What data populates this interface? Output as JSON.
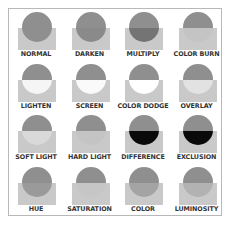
{
  "colors": {
    "frame_border": "#b8b8b8",
    "rect": "#c9c9c9",
    "circle": "#8f8f8f",
    "label": "#333333"
  },
  "modes": [
    {
      "label": "NORMAL",
      "top": "#8f8f8f",
      "bottom": "#8f8f8f",
      "rect": "#c9c9c9"
    },
    {
      "label": "DARKEN",
      "top": "#8f8f8f",
      "bottom": "#8a8a8a",
      "rect": "#c9c9c9"
    },
    {
      "label": "MULTIPLY",
      "top": "#8f8f8f",
      "bottom": "#747474",
      "rect": "#c9c9c9"
    },
    {
      "label": "COLOR BURN",
      "top": "#8f8f8f",
      "bottom": "#c4c4c4",
      "rect": "#c9c9c9"
    },
    {
      "label": "LIGHTEN",
      "top": "#8f8f8f",
      "bottom": "#f5f5f5",
      "rect": "#c9c9c9"
    },
    {
      "label": "SCREEN",
      "top": "#8f8f8f",
      "bottom": "#fafafa",
      "rect": "#c9c9c9"
    },
    {
      "label": "COLOR DODGE",
      "top": "#8f8f8f",
      "bottom": "#ffffff",
      "rect": "#c9c9c9"
    },
    {
      "label": "OVERLAY",
      "top": "#8f8f8f",
      "bottom": "#e2e2e2",
      "rect": "#c9c9c9"
    },
    {
      "label": "SOFT LIGHT",
      "top": "#8f8f8f",
      "bottom": "#d9d9d9",
      "rect": "#c9c9c9"
    },
    {
      "label": "HARD LIGHT",
      "top": "#8f8f8f",
      "bottom": "#c4c4c4",
      "rect": "#c9c9c9"
    },
    {
      "label": "DIFFERENCE",
      "top": "#8f8f8f",
      "bottom": "#0a0a0a",
      "rect": "#c9c9c9"
    },
    {
      "label": "EXCLUSION",
      "top": "#8f8f8f",
      "bottom": "#0a0a0a",
      "rect": "#c9c9c9"
    },
    {
      "label": "HUE",
      "top": "#8f8f8f",
      "bottom": "#9a9a9a",
      "rect": "#c9c9c9"
    },
    {
      "label": "SATURATION",
      "top": "#8f8f8f",
      "bottom": "#c6c6c6",
      "rect": "#c9c9c9"
    },
    {
      "label": "COLOR",
      "top": "#8f8f8f",
      "bottom": "#a4a4a4",
      "rect": "#c9c9c9"
    },
    {
      "label": "LUMINOSITY",
      "top": "#8f8f8f",
      "bottom": "#b2b2b2",
      "rect": "#c9c9c9"
    }
  ]
}
